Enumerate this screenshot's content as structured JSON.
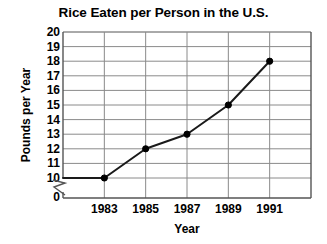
{
  "chart_data": {
    "type": "line",
    "title": "Rice Eaten per Person in the U.S.",
    "xlabel": "Year",
    "ylabel": "Pounds per Year",
    "categories": [
      "1983",
      "1985",
      "1987",
      "1989",
      "1991"
    ],
    "x": [
      1983,
      1985,
      1987,
      1989,
      1991
    ],
    "values": [
      10,
      12,
      13,
      15,
      18
    ],
    "series": [
      {
        "name": "Rice eaten per person",
        "values": [
          10,
          12,
          13,
          15,
          18
        ]
      }
    ],
    "ylim": [
      10,
      20
    ],
    "yticks": [
      20,
      19,
      18,
      17,
      16,
      15,
      14,
      13,
      12,
      11,
      10
    ],
    "y_axis_break": true,
    "y_axis_break_label": "0",
    "xticks": [
      "1983",
      "1985",
      "1987",
      "1989",
      "1991"
    ],
    "grid": true,
    "legend": null,
    "legend_position": "none",
    "marker": "filled-circle",
    "units": "pounds per year",
    "colors": {
      "line": "#1a1a1a",
      "marker": "#000000",
      "grid": "#8a8a8a",
      "axis": "#555555",
      "text": "#000000",
      "background": "#ffffff"
    }
  }
}
